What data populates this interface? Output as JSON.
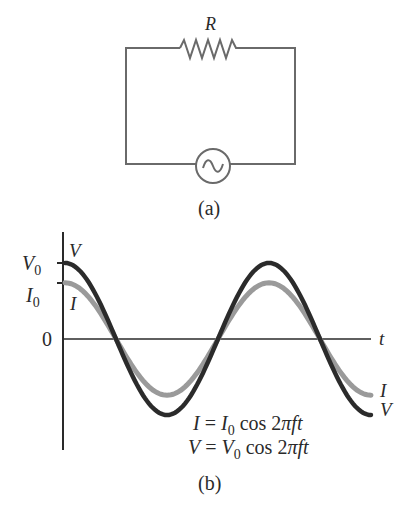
{
  "circuit": {
    "resistor_label": "R",
    "source_symbol": "~",
    "caption": "(a)"
  },
  "graph": {
    "caption": "(b)",
    "y_labels": {
      "v0": "V",
      "v0_sub": "0",
      "i0": "I",
      "i0_sub": "0",
      "zero": "0"
    },
    "x_label": "t",
    "curve_labels": {
      "v_start": "V",
      "i_start": "I",
      "i_end": "I",
      "v_end": "V"
    },
    "equations": [
      {
        "lhs": "I",
        "eq": " = ",
        "amp": "I",
        "sub": "0",
        "rest": " cos 2",
        "pi": "π",
        "tail": "ft"
      },
      {
        "lhs": "V",
        "eq": " = ",
        "amp": "V",
        "sub": "0",
        "rest": " cos 2",
        "pi": "π",
        "tail": "ft"
      }
    ],
    "colors": {
      "voltage": "#2b2b2b",
      "current": "#9a9a9a",
      "axis": "#2a2a2a",
      "wire": "#6a6a6a"
    }
  },
  "chart_data": {
    "type": "line",
    "title": "",
    "xlabel": "t",
    "ylabel": "",
    "series": [
      {
        "name": "V = V0 cos 2πft",
        "amplitude": 1.0,
        "phase": 0,
        "color": "#2b2b2b"
      },
      {
        "name": "I = I0 cos 2πft",
        "amplitude": 0.74,
        "phase": 0,
        "color": "#9a9a9a"
      }
    ],
    "x_range_cycles": [
      0,
      1.5
    ],
    "y_ticks": [
      "V0",
      "I0",
      "0"
    ],
    "grid": false
  }
}
